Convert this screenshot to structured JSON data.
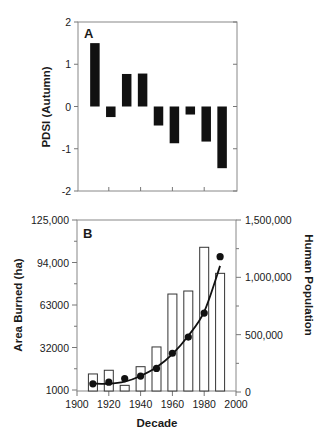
{
  "chart_data": [
    {
      "panel": "A",
      "type": "bar",
      "title": "",
      "panel_label": "A",
      "xlabel": "",
      "ylabel": "PDSI (Autumn)",
      "categories": [
        "1910",
        "1920",
        "1930",
        "1940",
        "1950",
        "1960",
        "1970",
        "1980",
        "1990"
      ],
      "x": [
        1910,
        1920,
        1930,
        1940,
        1950,
        1960,
        1970,
        1980,
        1990
      ],
      "values": [
        1.5,
        -0.25,
        0.77,
        0.78,
        -0.45,
        -0.87,
        -0.19,
        -0.83,
        -1.46
      ],
      "xlim": [
        1900,
        2000
      ],
      "ylim": [
        -2,
        2
      ],
      "yticks": [
        2,
        1,
        0,
        -1,
        -2
      ],
      "ytick_labels": [
        "2",
        "1",
        "0",
        "-1",
        "-2"
      ],
      "xticks": [
        1920,
        1940,
        1960,
        1980
      ],
      "xtick_labels_shown": false,
      "grid": false,
      "legend": null
    },
    {
      "panel": "B",
      "type": "bar+scatter",
      "panel_label": "B",
      "title": "",
      "xlabel": "Decade",
      "ylabel": "Area Burned (ha)",
      "ylabel_right": "Human Population",
      "x": [
        1910,
        1920,
        1930,
        1940,
        1950,
        1960,
        1970,
        1980,
        1990
      ],
      "xlim": [
        1900,
        2000
      ],
      "xticks": [
        1900,
        1920,
        1940,
        1960,
        1980,
        2000
      ],
      "xtick_labels": [
        "1900",
        "1920",
        "1940",
        "1960",
        "1980",
        "2000"
      ],
      "ylim": [
        1000,
        125000
      ],
      "yticks": [
        125000,
        94000,
        63000,
        32000,
        1000
      ],
      "ytick_labels": [
        "125,000",
        "94,000",
        "63000",
        "32000",
        "1000"
      ],
      "ylim_right": [
        0,
        1500000
      ],
      "yticks_right": [
        1500000,
        1000000,
        500000,
        0
      ],
      "ytick_labels_right": [
        "1,500,000",
        "1,000,000",
        "500,000",
        "0"
      ],
      "series": [
        {
          "name": "Area Burned (ha)",
          "type": "bar",
          "axis": "left",
          "style": "open",
          "values": [
            12700,
            15400,
            4400,
            18000,
            32400,
            71000,
            73200,
            105100,
            86100
          ]
        },
        {
          "name": "Human Population",
          "type": "scatter",
          "axis": "right",
          "style": "filled-circle",
          "values": [
            71000,
            86000,
            117000,
            139000,
            206000,
            338000,
            479000,
            688000,
            1180000
          ]
        },
        {
          "name": "Population trend (fitted curve)",
          "type": "line",
          "axis": "right",
          "x": [
            1910,
            1920,
            1930,
            1940,
            1950,
            1960,
            1970,
            1980,
            1990
          ],
          "values": [
            75000,
            72000,
            90000,
            140000,
            215000,
            330000,
            490000,
            700000,
            1100000
          ]
        }
      ],
      "grid": false,
      "legend": null
    }
  ]
}
